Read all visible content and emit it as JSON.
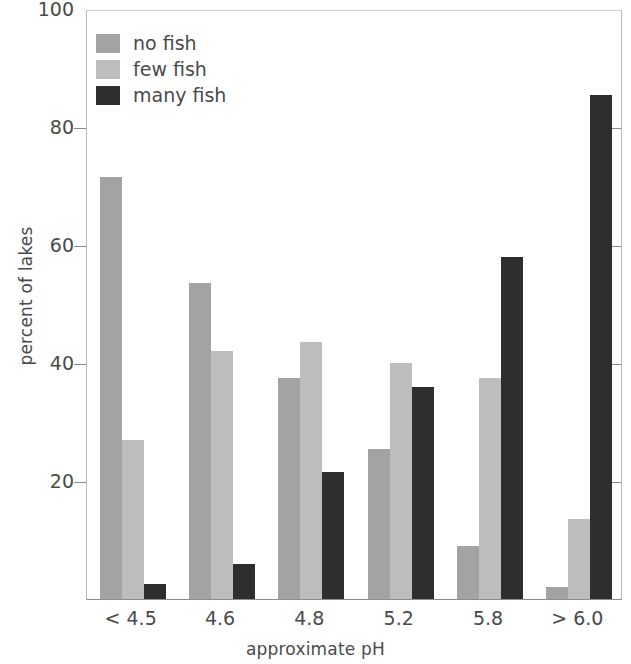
{
  "chart_data": {
    "type": "bar",
    "title": "",
    "xlabel": "approximate pH",
    "ylabel": "percent of lakes",
    "categories": [
      "< 4.5",
      "4.6",
      "4.8",
      "5.2",
      "5.8",
      "> 6.0"
    ],
    "series": [
      {
        "name": "no fish",
        "color": "#a3a3a3",
        "values": [
          71.5,
          53.5,
          37.5,
          25.5,
          9.0,
          2.0
        ]
      },
      {
        "name": "few fish",
        "color": "#bdbdbd",
        "values": [
          27.0,
          42.0,
          43.5,
          40.0,
          37.5,
          13.5
        ]
      },
      {
        "name": "many fish",
        "color": "#2e2e2e",
        "values": [
          2.5,
          6.0,
          21.5,
          36.0,
          58.0,
          85.5
        ]
      }
    ],
    "ylim": [
      0,
      100
    ],
    "yticks": [
      20,
      40,
      60,
      80,
      100
    ],
    "ytick_labels": [
      "20",
      "40",
      "60",
      "80",
      "100"
    ],
    "grid": false,
    "legend_position": "top-center",
    "legend_entries": [
      "no fish",
      "few fish",
      "many fish"
    ]
  }
}
